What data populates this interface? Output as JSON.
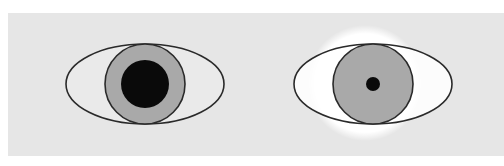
{
  "figure": {
    "colors": {
      "background": "#ffffff",
      "panel": "#e6e6e6",
      "sclera": "#ececec",
      "iris": "#a9a9a9",
      "pupil": "#0a0a0a",
      "outline": "#2a2a2a",
      "light_glow": "#ffffff"
    },
    "eyes": [
      {
        "id": "left",
        "state": "dilated-pupil",
        "cx": 145,
        "cy": 84,
        "eye_rx": 79,
        "eye_ry": 40,
        "iris_r": 40,
        "pupil_r": 24,
        "glow": false
      },
      {
        "id": "right",
        "state": "constricted-pupil",
        "cx": 373,
        "cy": 84,
        "eye_rx": 79,
        "eye_ry": 40,
        "iris_r": 40,
        "pupil_r": 7,
        "glow": true,
        "glow_cx": 365,
        "glow_cy": 83,
        "glow_r": 58
      }
    ]
  }
}
